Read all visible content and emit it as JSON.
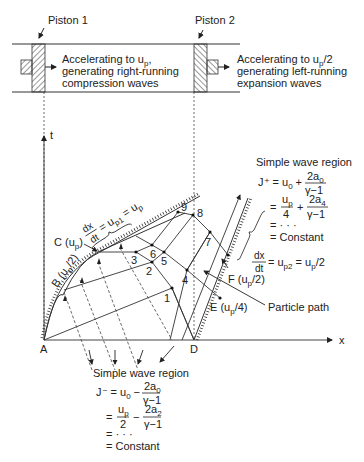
{
  "pistons": {
    "piston1": {
      "label": "Piston 1",
      "desc": [
        "Accelerating to u",
        "p",
        ",",
        "generating right-running",
        "compression waves"
      ]
    },
    "piston2": {
      "label": "Piston 2",
      "desc": [
        "Accelerating to u",
        "p",
        "/2",
        "generating left-running",
        "expansion waves"
      ]
    }
  },
  "axes": {
    "t": "t",
    "x": "x",
    "origin_left": "A",
    "origin_right": "D"
  },
  "points": {
    "p1": "1",
    "p2": "2",
    "p3": "3",
    "p4": "4",
    "p5": "5",
    "p6": "6",
    "p7": "7",
    "p8": "8",
    "p9": "9"
  },
  "labels": {
    "B": "B (u",
    "B_sub": "p",
    "B_end": "/2)",
    "C": "C (u",
    "C_sub": "p",
    "C_end": ")",
    "E": "E (u",
    "E_sub": "p",
    "E_end": "/4)",
    "F": "F (u",
    "F_sub": "p",
    "F_end": "/2)",
    "particle_path": "Particle path"
  },
  "slope_left": {
    "num": "dx",
    "den": "dt",
    "rhs": "= u",
    "sub1": "p1",
    "rhs2": " = u",
    "sub2": "p"
  },
  "slope_right": {
    "num": "dx",
    "den": "dt",
    "rhs": "= u",
    "sub1": "p2",
    "rhs2": " = u",
    "sub2": "p",
    "tail": "/2"
  },
  "simple_wave_right": {
    "title": "Simple wave region",
    "line1_lhs": "J⁺ = u",
    "line1_sub": "0",
    "line1_op": "+",
    "line1_num": "2a",
    "line1_num_sub": "0",
    "line1_den": "γ−1",
    "line2_eq": "=",
    "line2_num": "u",
    "line2_num_sub": "p",
    "line2_den": "4",
    "line2_op": "+",
    "line2_num2": "2a",
    "line2_num2_sub": "4",
    "line2_den2": "γ−1",
    "line3": "=  · · ·",
    "line4": "=  Constant"
  },
  "simple_wave_bottom": {
    "title": "Simple wave region",
    "line1_lhs": "J⁻ = u",
    "line1_sub": "0",
    "line1_op": "−",
    "line1_num": "2a",
    "line1_num_sub": "0",
    "line1_den": "γ−1",
    "line2_eq": "=",
    "line2_num": "u",
    "line2_num_sub": "p",
    "line2_den": "2",
    "line2_op": "−",
    "line2_num2": "2a",
    "line2_num2_sub": "2",
    "line2_den2": "γ−1",
    "line3": "=  · · ·",
    "line4": "=  Constant"
  }
}
